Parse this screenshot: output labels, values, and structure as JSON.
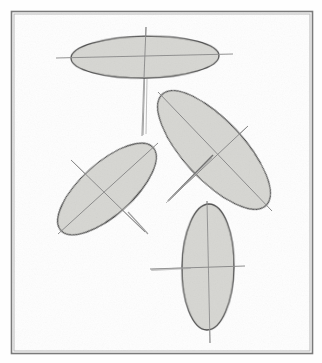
{
  "figure": {
    "kind": "line-drawing",
    "canvas": {
      "width": 322,
      "height": 363
    },
    "background_color": "#fefefe",
    "border": {
      "name": "figure-frame",
      "x": 11,
      "y": 11,
      "width": 301,
      "height": 342,
      "stroke_color": "#7a7a7a",
      "stroke_width": 1.6,
      "inner_stroke_color": "#b9b9b9",
      "inner_stroke_width": 1
    },
    "palette": {
      "ellipse_fill": "#d6d6d2",
      "ellipse_fill_light": "#dedeDa",
      "ellipse_outline": "#4a4a4a",
      "ellipse_outline_soft": "#8c8c8c",
      "axis_line": "#9a9a9a",
      "axis_line_dark": "#6f6f6f",
      "shadow": "#c4c4c0"
    },
    "ellipses": [
      {
        "id": "ellipse-top",
        "label": "Top wide ellipse",
        "center_x": 145,
        "center_y": 57,
        "radius_x": 74,
        "radius_y": 21,
        "rotation_deg": -1,
        "fill": "#d6d6d2",
        "outline": "#4a4a4a",
        "major_axis": {
          "x1": 56,
          "y1": 58,
          "x2": 233,
          "y2": 54
        },
        "minor_axis": {
          "x1": 146,
          "y1": 27,
          "x2": 143,
          "y2": 135
        }
      },
      {
        "id": "ellipse-right-tilted",
        "label": "Right tilted ellipse",
        "center_x": 214,
        "center_y": 150,
        "radius_x": 76,
        "radius_y": 30,
        "rotation_deg": 47,
        "fill": "#d6d6d2",
        "outline": "#4a4a4a",
        "major_axis": {
          "x1": 158,
          "y1": 92,
          "x2": 272,
          "y2": 211
        },
        "minor_axis": {
          "x1": 169,
          "y1": 200,
          "x2": 248,
          "y2": 126
        }
      },
      {
        "id": "ellipse-left-tilted",
        "label": "Left tilted ellipse",
        "center_x": 107,
        "center_y": 189,
        "radius_x": 62,
        "radius_y": 26,
        "rotation_deg": -42,
        "fill": "#d6d6d2",
        "outline": "#4a4a4a",
        "major_axis": {
          "x1": 58,
          "y1": 234,
          "x2": 158,
          "y2": 143
        },
        "minor_axis": {
          "x1": 71,
          "y1": 160,
          "x2": 145,
          "y2": 232
        }
      },
      {
        "id": "ellipse-bottom",
        "label": "Bottom tall ellipse",
        "center_x": 208,
        "center_y": 267,
        "radius_x": 26,
        "radius_y": 63,
        "rotation_deg": 1,
        "fill": "#d6d6d2",
        "outline": "#4a4a4a",
        "major_axis": {
          "x1": 207,
          "y1": 201,
          "x2": 210,
          "y2": 343
        },
        "minor_axis": {
          "x1": 150,
          "y1": 269,
          "x2": 245,
          "y2": 266
        }
      }
    ],
    "stray_marks": [
      {
        "id": "stray-top-stem",
        "x1": 144,
        "y1": 77,
        "x2": 142,
        "y2": 136
      },
      {
        "id": "stray-right-needle",
        "x1": 168,
        "y1": 201,
        "x2": 213,
        "y2": 155
      },
      {
        "id": "stray-left-tail",
        "x1": 128,
        "y1": 212,
        "x2": 148,
        "y2": 234
      }
    ]
  }
}
